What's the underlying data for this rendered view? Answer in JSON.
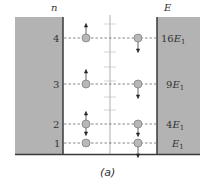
{
  "figure": {
    "caption": "(a)",
    "left_axis_label": "n",
    "right_axis_label": "E",
    "levels": [
      {
        "n": "4",
        "energy": "16",
        "energy_sub": "1",
        "y": 38,
        "left_arrow": "up",
        "right_arrow": "down"
      },
      {
        "n": "3",
        "energy": "9",
        "energy_sub": "1",
        "y": 84,
        "left_arrow": "up",
        "right_arrow": "down"
      },
      {
        "n": "2",
        "energy": "4",
        "energy_sub": "1",
        "y": 124,
        "left_arrow": "up-down",
        "right_arrow": "down"
      },
      {
        "n": "1",
        "energy": "",
        "energy_sub": "1",
        "y": 143,
        "left_arrow": "none",
        "right_arrow": "down"
      }
    ],
    "labels": {
      "n4": "4",
      "n3": "3",
      "n2": "2",
      "n1": "1",
      "e4": "16E",
      "e3": "9E",
      "e2": "4E",
      "e1": "E",
      "sub": "1"
    },
    "colors": {
      "wall": "#b3b3b3",
      "wall_edge": "#3a3a3a",
      "particle": "#b8b8b8",
      "dashed": "#555555",
      "center_line": "#999999"
    }
  }
}
